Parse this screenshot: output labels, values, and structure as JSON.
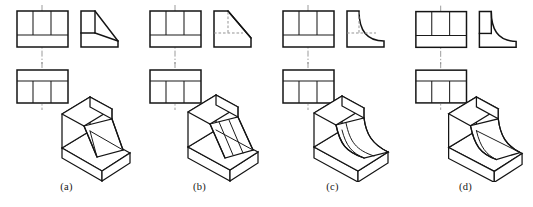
{
  "figure": {
    "kind": "engineering-drawing-multiple-choice",
    "background_color": "#ffffff",
    "line_color": "#141414",
    "hidden_line_color": "#8e8e8e",
    "center_line_color": "#8a8a8a"
  },
  "options": [
    {
      "id": "a",
      "label": "(a)",
      "views": {
        "front": {
          "name": "front-view",
          "outline": "rectangle",
          "internal_divisions": 3,
          "lower_band": true,
          "centerline": "vertical"
        },
        "side": {
          "name": "right-side-view",
          "profile": "L-shape with straight chamfer",
          "transition": "straight",
          "hidden_lines": false
        },
        "top": {
          "name": "top-view",
          "outline": "rectangle",
          "upper_band": true,
          "internal_divisions": 3,
          "centerline": "vertical"
        }
      },
      "pictorial": {
        "name": "isometric-view",
        "feature": "straight inclined web between vertical rib and base",
        "transition": "straight"
      }
    },
    {
      "id": "b",
      "label": "(b)",
      "views": {
        "front": {
          "name": "front-view",
          "outline": "rectangle",
          "internal_divisions": 3,
          "lower_band": true,
          "centerline": "vertical"
        },
        "side": {
          "name": "right-side-view",
          "profile": "Full triangular chamfer from top-left to bottom-right",
          "transition": "straight",
          "hidden_lines": true
        },
        "top": {
          "name": "top-view",
          "outline": "rectangle",
          "upper_band": true,
          "internal_divisions": 3,
          "centerline": "vertical"
        }
      },
      "pictorial": {
        "name": "isometric-view",
        "feature": "full-height inclined slope face with ribs",
        "transition": "straight"
      }
    },
    {
      "id": "c",
      "label": "(c)",
      "views": {
        "front": {
          "name": "front-view",
          "outline": "rectangle",
          "internal_divisions": 3,
          "lower_band": true,
          "centerline": "vertical"
        },
        "side": {
          "name": "right-side-view",
          "profile": "L-shape with concave fillet curve",
          "transition": "curved",
          "hidden_lines": true
        },
        "top": {
          "name": "top-view",
          "outline": "rectangle",
          "upper_band": true,
          "internal_divisions": 3,
          "centerline": "vertical"
        }
      },
      "pictorial": {
        "name": "isometric-view",
        "feature": "curved concave web sweeping from vertical rib to base",
        "transition": "curved"
      }
    },
    {
      "id": "d",
      "label": "(d)",
      "views": {
        "front": {
          "name": "front-view",
          "outline": "rectangle",
          "internal_divisions": 3,
          "lower_band": true,
          "centerline": "vertical"
        },
        "side": {
          "name": "right-side-view",
          "profile": "L-shape with concave curve, solid inner corner",
          "transition": "curved",
          "hidden_lines": false
        },
        "top": {
          "name": "top-view",
          "outline": "rectangle",
          "upper_band": true,
          "internal_divisions": 3,
          "centerline": "vertical"
        }
      },
      "pictorial": {
        "name": "isometric-view",
        "feature": "curved concave web with stepped base",
        "transition": "curved"
      }
    }
  ]
}
